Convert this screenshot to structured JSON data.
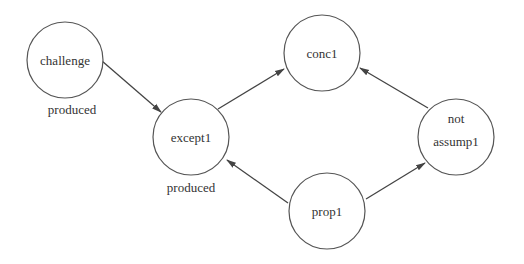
{
  "diagram": {
    "type": "directed-graph",
    "nodes": [
      {
        "id": "challenge",
        "label": "challenge",
        "cx": 65,
        "cy": 60,
        "r": 38,
        "annotation": "produced"
      },
      {
        "id": "conc1",
        "label": "conc1",
        "cx": 322,
        "cy": 53,
        "r": 38
      },
      {
        "id": "except1",
        "label": "except1",
        "cx": 191,
        "cy": 137,
        "r": 38,
        "annotation": "produced"
      },
      {
        "id": "notassump1",
        "label_line1": "not",
        "label_line2": "assump1",
        "cx": 456,
        "cy": 137,
        "r": 38
      },
      {
        "id": "prop1",
        "label": "prop1",
        "cx": 327,
        "cy": 211,
        "r": 38
      }
    ],
    "edges": [
      {
        "from": "challenge",
        "to": "except1"
      },
      {
        "from": "except1",
        "to": "conc1"
      },
      {
        "from": "notassump1",
        "to": "conc1"
      },
      {
        "from": "prop1",
        "to": "except1"
      },
      {
        "from": "prop1",
        "to": "notassump1"
      }
    ],
    "annotations": {
      "challenge": "produced",
      "except1": "produced"
    },
    "colors": {
      "stroke": "#555555",
      "text": "#333333",
      "background": "#ffffff"
    }
  }
}
